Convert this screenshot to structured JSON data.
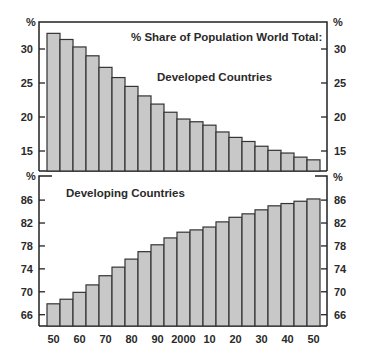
{
  "chart_data": [
    {
      "type": "bar",
      "title": "% Share of Population World Total:",
      "subtitle": "Developed Countries",
      "xlabel": "",
      "ylabel": "%",
      "ylim": [
        12,
        33.9
      ],
      "yticks": [
        15,
        20,
        25,
        30
      ],
      "grid": false,
      "categories": [
        "1950",
        "1955",
        "1960",
        "1965",
        "1970",
        "1975",
        "1980",
        "1985",
        "1990",
        "1995",
        "2000",
        "2005",
        "2010",
        "2015",
        "2020",
        "2025",
        "2030",
        "2035",
        "2040",
        "2045",
        "2050"
      ],
      "series": [
        {
          "name": "Developed Countries",
          "values": [
            32.3,
            31.4,
            30.3,
            29.0,
            27.3,
            25.8,
            24.5,
            23.1,
            21.9,
            20.7,
            19.7,
            19.3,
            18.8,
            17.8,
            17.0,
            16.4,
            15.7,
            15.1,
            14.7,
            14.1,
            13.7
          ]
        }
      ]
    },
    {
      "type": "bar",
      "title": "",
      "subtitle": "Developing Countries",
      "xlabel": "",
      "ylabel": "%",
      "ylim": [
        64,
        88.3
      ],
      "yticks": [
        66,
        70,
        74,
        78,
        82,
        86
      ],
      "grid": false,
      "categories": [
        "1950",
        "1955",
        "1960",
        "1965",
        "1970",
        "1975",
        "1980",
        "1985",
        "1990",
        "1995",
        "2000",
        "2005",
        "2010",
        "2015",
        "2020",
        "2025",
        "2030",
        "2035",
        "2040",
        "2045",
        "2050"
      ],
      "x_tick_labels": [
        "50",
        "60",
        "70",
        "80",
        "90",
        "2000",
        "10",
        "20",
        "30",
        "40",
        "50"
      ],
      "series": [
        {
          "name": "Developing Countries",
          "values": [
            67.9,
            68.7,
            69.9,
            71.2,
            72.8,
            74.3,
            75.7,
            77.0,
            78.2,
            79.4,
            80.4,
            80.8,
            81.3,
            82.2,
            83.0,
            83.6,
            84.3,
            85.0,
            85.4,
            85.8,
            86.2
          ]
        }
      ]
    }
  ],
  "labels": {
    "title": "% Share of Population World Total:",
    "top_series": "Developed Countries",
    "bottom_series": "Developing Countries",
    "percent": "%"
  },
  "colors": {
    "bar_fill": "#c8c8c8",
    "bar_stroke": "#333333",
    "axis": "#222222"
  }
}
